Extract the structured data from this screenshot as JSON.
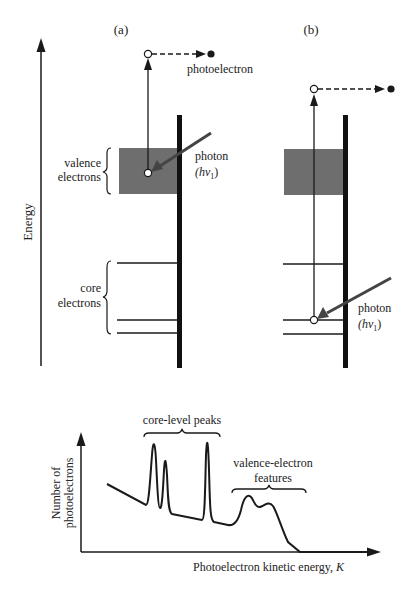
{
  "energy_axis": {
    "label": "Energy"
  },
  "panel_a": {
    "label": "(a)",
    "photoelectron_label": "photoelectron",
    "valence_label_line1": "valence",
    "valence_label_line2": "electrons",
    "core_label_line1": "core",
    "core_label_line2": "electrons",
    "photon_label": "photon",
    "photon_energy_h": "(hv",
    "photon_energy_sub": "1",
    "photon_energy_close": ")"
  },
  "panel_b": {
    "label": "(b)",
    "photon_label": "photon",
    "photon_energy_h": "(hv",
    "photon_energy_sub": "1",
    "photon_energy_close": ")"
  },
  "spectrum": {
    "ylabel_line1": "Number of",
    "ylabel_line2": "photoelectrons",
    "xlabel": "Photoelectron kinetic energy, ",
    "xlabel_var": "K",
    "core_peaks_label": "core-level peaks",
    "valence_features_line1": "valence-electron",
    "valence_features_line2": "features"
  },
  "colors": {
    "line": "#1a1a1a",
    "band_fill": "#6e6e6e",
    "photon_arrow": "#444444",
    "background": "#ffffff"
  }
}
